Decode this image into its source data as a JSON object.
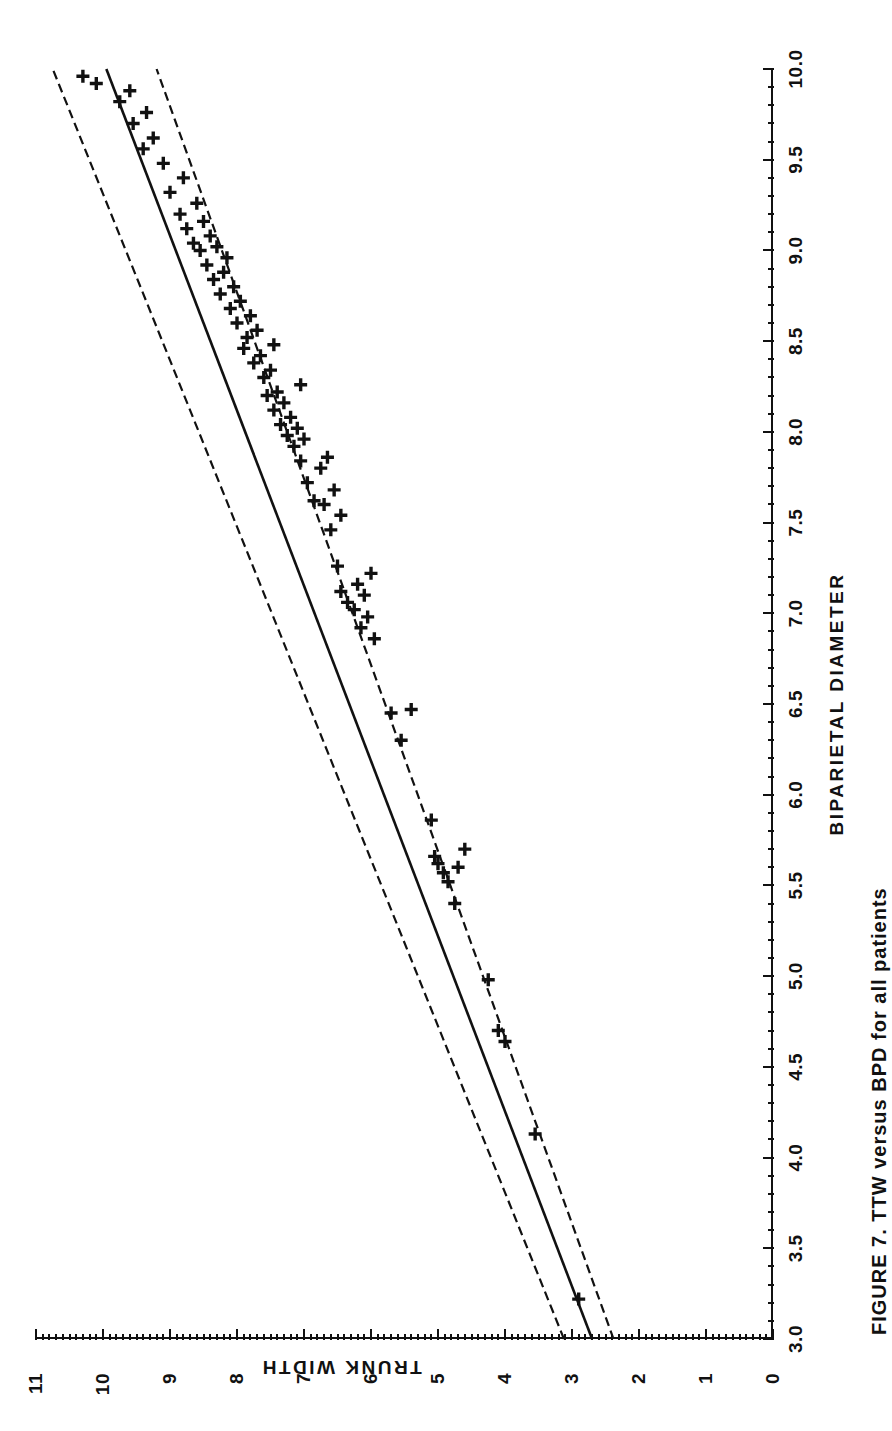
{
  "figure": {
    "caption": "FIGURE 7.  TTW versus BPD for all patients"
  },
  "axes": {
    "x": {
      "title": "BIPARIETAL DIAMETER",
      "min": 3.0,
      "max": 10.0,
      "major_step": 0.5,
      "minor_step": 0.1,
      "tick_labels": [
        "3.0",
        "3.5",
        "4.0",
        "4.5",
        "5.0",
        "5.5",
        "6.0",
        "6.5",
        "7.0",
        "7.5",
        "8.0",
        "8.5",
        "9.0",
        "9.5",
        "10.0"
      ]
    },
    "y": {
      "title": "TRUNK WIDTH",
      "min": 0,
      "max": 11,
      "major_step": 1,
      "minor_step": 0.1,
      "tick_labels": [
        "0",
        "1",
        "2",
        "3",
        "4",
        "5",
        "6",
        "7",
        "8",
        "9",
        "10",
        "11"
      ]
    }
  },
  "style": {
    "line_color": "#111111",
    "marker_color": "#111111",
    "background": "#ffffff",
    "marker": "plus"
  },
  "chart_data": {
    "type": "scatter",
    "title": "",
    "xlabel": "BIPARIETAL DIAMETER",
    "ylabel": "TRUNK WIDTH",
    "xlim": [
      3.0,
      10.0
    ],
    "ylim": [
      0,
      11
    ],
    "grid": false,
    "legend": "none",
    "series": [
      {
        "name": "observations",
        "type": "scatter",
        "marker": "+",
        "x": [
          3.22,
          4.13,
          4.64,
          4.7,
          4.98,
          5.4,
          5.52,
          5.57,
          5.6,
          5.62,
          5.66,
          5.7,
          5.86,
          6.3,
          6.45,
          6.47,
          6.86,
          6.92,
          6.98,
          7.02,
          7.06,
          7.1,
          7.12,
          7.16,
          7.22,
          7.26,
          7.46,
          7.54,
          7.6,
          7.62,
          7.68,
          7.72,
          7.8,
          7.84,
          7.86,
          7.92,
          7.96,
          7.98,
          8.02,
          8.04,
          8.08,
          8.12,
          8.16,
          8.2,
          8.22,
          8.26,
          8.3,
          8.34,
          8.38,
          8.42,
          8.46,
          8.48,
          8.52,
          8.56,
          8.6,
          8.64,
          8.68,
          8.72,
          8.76,
          8.8,
          8.84,
          8.88,
          8.92,
          8.96,
          9.0,
          9.02,
          9.04,
          9.08,
          9.12,
          9.16,
          9.2,
          9.26,
          9.32,
          9.4,
          9.48,
          9.56,
          9.62,
          9.7,
          9.76,
          9.82,
          9.88,
          9.92,
          9.96
        ],
        "y": [
          2.9,
          3.55,
          4.0,
          4.1,
          4.25,
          4.75,
          4.85,
          4.92,
          4.7,
          5.0,
          5.05,
          4.6,
          5.1,
          5.55,
          5.7,
          5.4,
          5.95,
          6.15,
          6.05,
          6.25,
          6.35,
          6.1,
          6.45,
          6.2,
          6.0,
          6.5,
          6.6,
          6.45,
          6.7,
          6.85,
          6.55,
          6.95,
          6.75,
          7.05,
          6.65,
          7.15,
          7.0,
          7.25,
          7.1,
          7.35,
          7.2,
          7.45,
          7.3,
          7.55,
          7.4,
          7.05,
          7.6,
          7.5,
          7.75,
          7.65,
          7.9,
          7.45,
          7.85,
          7.7,
          8.0,
          7.8,
          8.1,
          7.95,
          8.25,
          8.05,
          8.35,
          8.2,
          8.45,
          8.15,
          8.55,
          8.3,
          8.65,
          8.4,
          8.75,
          8.5,
          8.85,
          8.6,
          9.0,
          8.8,
          9.1,
          9.4,
          9.25,
          9.55,
          9.35,
          9.75,
          9.6,
          10.1,
          10.3
        ]
      },
      {
        "name": "regression line",
        "type": "line",
        "style": "solid",
        "x": [
          3.0,
          10.0
        ],
        "y": [
          2.7,
          9.95
        ]
      },
      {
        "name": "upper confidence limit",
        "type": "line",
        "style": "dashed",
        "x": [
          3.0,
          10.0
        ],
        "y": [
          3.12,
          10.75
        ]
      },
      {
        "name": "lower confidence limit",
        "type": "line",
        "style": "dashed",
        "x": [
          3.0,
          10.0
        ],
        "y": [
          2.38,
          9.2
        ]
      }
    ]
  }
}
